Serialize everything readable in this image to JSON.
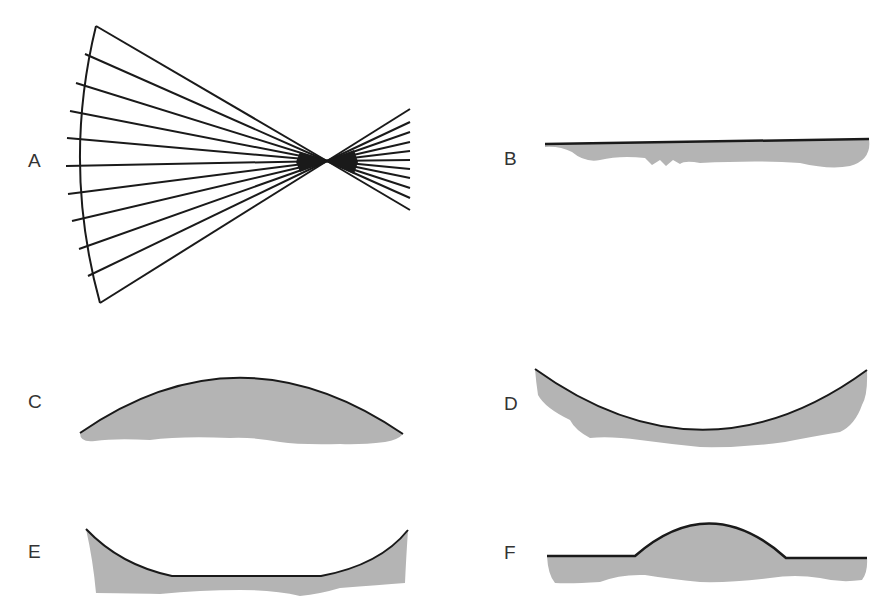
{
  "diagram": {
    "colors": {
      "stroke": "#1a1a1a",
      "fill": "#b4b4b4",
      "label": "#333333"
    },
    "panels": [
      {
        "id": "A",
        "label": "A",
        "shape": "converging ray fan through focal point"
      },
      {
        "id": "B",
        "label": "B",
        "shape": "flat surface"
      },
      {
        "id": "C",
        "label": "C",
        "shape": "convex (domed) surface"
      },
      {
        "id": "D",
        "label": "D",
        "shape": "concave (bowl) surface"
      },
      {
        "id": "E",
        "label": "E",
        "shape": "concave with flat bottom"
      },
      {
        "id": "F",
        "label": "F",
        "shape": "flat with central bump"
      }
    ]
  }
}
